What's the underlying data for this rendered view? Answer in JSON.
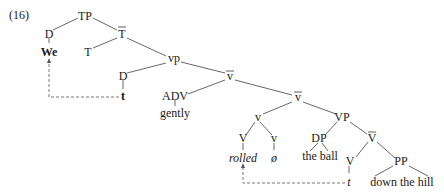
{
  "example_number": "(16)",
  "nodes": {
    "tp": "TP",
    "d1": "D",
    "we": "We",
    "tbar": "T",
    "t": "T",
    "vp_small": "vp",
    "d2": "D",
    "trace_subject": "t",
    "vbar1": "v",
    "adv": "ADV",
    "gently": "gently",
    "vbar2": "v",
    "v_small": "v",
    "VP": "VP",
    "V1": "V",
    "v_head": "v",
    "DP": "DP",
    "Vbar": "V",
    "rolled": "rolled",
    "null": "ø",
    "the_ball": "the ball",
    "V2": "V",
    "PP": "PP",
    "trace_verb": "t",
    "down_the_hill": "down the hill"
  }
}
